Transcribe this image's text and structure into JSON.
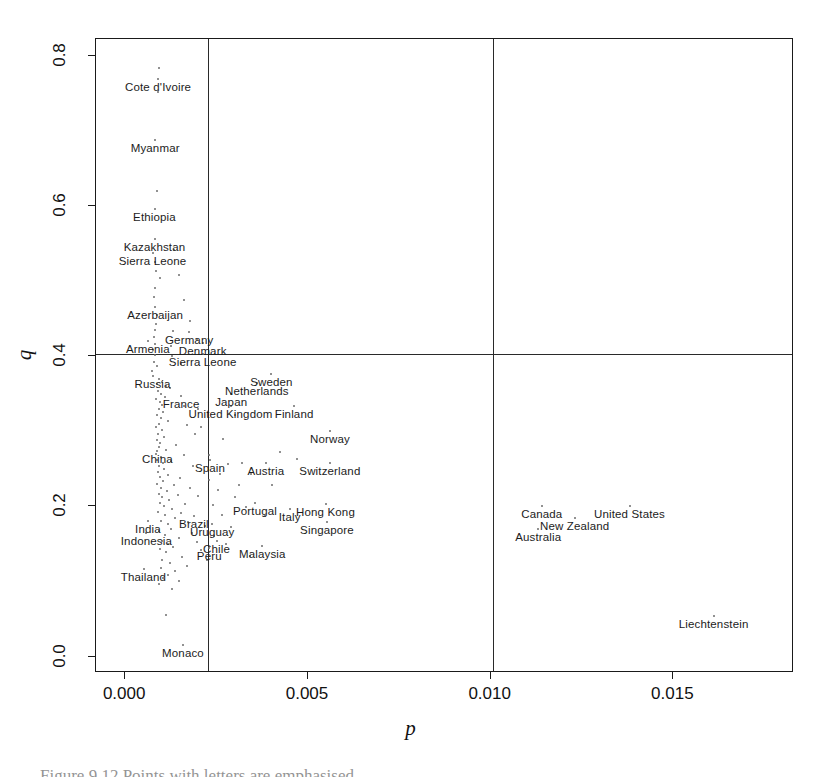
{
  "figure": {
    "caption": "Figure 9.12  Points with  letters  are  emphasised",
    "background": "#ffffff",
    "point_color": "#6d6d6d",
    "line_color": "#2a2a2a"
  },
  "chart_data": {
    "type": "scatter",
    "title": "",
    "xlabel": "p",
    "ylabel": "q",
    "xlim": [
      -0.0008,
      0.0183
    ],
    "ylim": [
      -0.022,
      0.822
    ],
    "xticks": [
      0.0,
      0.005,
      0.01,
      0.015
    ],
    "xticklabels": [
      "0.000",
      "0.005",
      "0.010",
      "0.015"
    ],
    "yticks": [
      0.0,
      0.2,
      0.4,
      0.6,
      0.8
    ],
    "yticklabels": [
      "0.0",
      "0.2",
      "0.4",
      "0.6",
      "0.8"
    ],
    "grid": false,
    "legend": null,
    "reference_lines": {
      "vertical": [
        0.00225,
        0.01005
      ],
      "horizontal": [
        0.403
      ]
    },
    "labeled_points": [
      {
        "name": "Cote d'Ivoire",
        "p": 0.0009,
        "q": 0.769
      },
      {
        "name": "Myanmar",
        "p": 0.00082,
        "q": 0.688
      },
      {
        "name": "Ethiopia",
        "p": 0.0008,
        "q": 0.596
      },
      {
        "name": "Kazakhstan",
        "p": 0.0008,
        "q": 0.556
      },
      {
        "name": "Sierra Leone",
        "p": 0.00075,
        "q": 0.537
      },
      {
        "name": "Azerbaijan",
        "p": 0.00082,
        "q": 0.465
      },
      {
        "name": "Armenia",
        "p": 0.00062,
        "q": 0.42
      },
      {
        "name": "Germany",
        "p": 0.00175,
        "q": 0.432
      },
      {
        "name": "Denmark",
        "p": 0.00212,
        "q": 0.418
      },
      {
        "name": "Sierra Leone",
        "p": 0.00212,
        "q": 0.403
      },
      {
        "name": "Russia",
        "p": 0.00075,
        "q": 0.374
      },
      {
        "name": "Sweden",
        "p": 0.004,
        "q": 0.376
      },
      {
        "name": "Netherlands",
        "p": 0.0036,
        "q": 0.364
      },
      {
        "name": "France",
        "p": 0.00153,
        "q": 0.347
      },
      {
        "name": "Japan",
        "p": 0.0029,
        "q": 0.349
      },
      {
        "name": "United Kingdom",
        "p": 0.00288,
        "q": 0.333
      },
      {
        "name": "Finland",
        "p": 0.00462,
        "q": 0.333
      },
      {
        "name": "Norway",
        "p": 0.0056,
        "q": 0.3
      },
      {
        "name": "China",
        "p": 0.00088,
        "q": 0.273
      },
      {
        "name": "Spain",
        "p": 0.00232,
        "q": 0.262
      },
      {
        "name": "Austria",
        "p": 0.00385,
        "q": 0.258
      },
      {
        "name": "Switzerland",
        "p": 0.0056,
        "q": 0.257
      },
      {
        "name": "Portugal",
        "p": 0.00355,
        "q": 0.204
      },
      {
        "name": "Italy",
        "p": 0.0045,
        "q": 0.196
      },
      {
        "name": "Hong Kong",
        "p": 0.00548,
        "q": 0.203
      },
      {
        "name": "Singapore",
        "p": 0.00552,
        "q": 0.179
      },
      {
        "name": "Canada",
        "p": 0.0114,
        "q": 0.201
      },
      {
        "name": "United States",
        "p": 0.0138,
        "q": 0.201
      },
      {
        "name": "New Zealand",
        "p": 0.0123,
        "q": 0.185
      },
      {
        "name": "Australia",
        "p": 0.0113,
        "q": 0.17
      },
      {
        "name": "India",
        "p": 0.00062,
        "q": 0.18
      },
      {
        "name": "Brazil",
        "p": 0.00188,
        "q": 0.187
      },
      {
        "name": "Uruguay",
        "p": 0.00238,
        "q": 0.176
      },
      {
        "name": "Indonesia",
        "p": 0.00058,
        "q": 0.164
      },
      {
        "name": "Chile",
        "p": 0.0025,
        "q": 0.154
      },
      {
        "name": "Peru",
        "p": 0.0023,
        "q": 0.144
      },
      {
        "name": "Malaysia",
        "p": 0.00375,
        "q": 0.147
      },
      {
        "name": "Thailand",
        "p": 0.0005,
        "q": 0.117
      },
      {
        "name": "Liechtenstein",
        "p": 0.0161,
        "q": 0.054
      },
      {
        "name": "Monaco",
        "p": 0.00158,
        "q": 0.016
      }
    ],
    "unlabeled_points": [
      {
        "p": 0.00091,
        "q": 0.7835
      },
      {
        "p": 0.0009,
        "q": 0.752
      },
      {
        "p": 0.00086,
        "q": 0.62
      },
      {
        "p": 0.00082,
        "q": 0.525
      },
      {
        "p": 0.00083,
        "q": 0.513
      },
      {
        "p": 0.00095,
        "q": 0.504
      },
      {
        "p": 0.00148,
        "q": 0.508
      },
      {
        "p": 0.0008,
        "q": 0.49
      },
      {
        "p": 0.00078,
        "q": 0.478
      },
      {
        "p": 0.00086,
        "q": 0.455
      },
      {
        "p": 0.00083,
        "q": 0.443
      },
      {
        "p": 0.0008,
        "q": 0.435
      },
      {
        "p": 0.0013,
        "q": 0.434
      },
      {
        "p": 0.00078,
        "q": 0.425
      },
      {
        "p": 0.00082,
        "q": 0.416
      },
      {
        "p": 0.00125,
        "q": 0.414
      },
      {
        "p": 0.00076,
        "q": 0.408
      },
      {
        "p": 0.00082,
        "q": 0.402
      },
      {
        "p": 0.00128,
        "q": 0.4
      },
      {
        "p": 0.00079,
        "q": 0.392
      },
      {
        "p": 0.00086,
        "q": 0.387
      },
      {
        "p": 0.00074,
        "q": 0.38
      },
      {
        "p": 0.00092,
        "q": 0.37
      },
      {
        "p": 0.001,
        "q": 0.366
      },
      {
        "p": 0.00088,
        "q": 0.363
      },
      {
        "p": 0.00112,
        "q": 0.36
      },
      {
        "p": 0.00122,
        "q": 0.358
      },
      {
        "p": 0.0009,
        "q": 0.354
      },
      {
        "p": 0.00098,
        "q": 0.35
      },
      {
        "p": 0.00108,
        "q": 0.346
      },
      {
        "p": 0.00085,
        "q": 0.343
      },
      {
        "p": 0.00095,
        "q": 0.339
      },
      {
        "p": 0.001,
        "q": 0.335
      },
      {
        "p": 0.0016,
        "q": 0.334
      },
      {
        "p": 0.003,
        "q": 0.321
      },
      {
        "p": 0.00091,
        "q": 0.33
      },
      {
        "p": 0.00103,
        "q": 0.326
      },
      {
        "p": 0.00088,
        "q": 0.322
      },
      {
        "p": 0.00097,
        "q": 0.318
      },
      {
        "p": 0.00118,
        "q": 0.314
      },
      {
        "p": 0.00092,
        "q": 0.31
      },
      {
        "p": 0.00084,
        "q": 0.306
      },
      {
        "p": 0.00168,
        "q": 0.308
      },
      {
        "p": 0.001,
        "q": 0.301
      },
      {
        "p": 0.0009,
        "q": 0.296
      },
      {
        "p": 0.00192,
        "q": 0.296
      },
      {
        "p": 0.00105,
        "q": 0.292
      },
      {
        "p": 0.00086,
        "q": 0.288
      },
      {
        "p": 0.00096,
        "q": 0.284
      },
      {
        "p": 0.0014,
        "q": 0.282
      },
      {
        "p": 0.00092,
        "q": 0.279
      },
      {
        "p": 0.00112,
        "q": 0.275
      },
      {
        "p": 0.00083,
        "q": 0.27
      },
      {
        "p": 0.00098,
        "q": 0.266
      },
      {
        "p": 0.0016,
        "q": 0.268
      },
      {
        "p": 0.00088,
        "q": 0.262
      },
      {
        "p": 0.00125,
        "q": 0.26
      },
      {
        "p": 0.00102,
        "q": 0.257
      },
      {
        "p": 0.00093,
        "q": 0.253
      },
      {
        "p": 0.00186,
        "q": 0.254
      },
      {
        "p": 0.0028,
        "q": 0.256
      },
      {
        "p": 0.0032,
        "q": 0.257
      },
      {
        "p": 0.00107,
        "q": 0.249
      },
      {
        "p": 0.0009,
        "q": 0.245
      },
      {
        "p": 0.00117,
        "q": 0.242
      },
      {
        "p": 0.00096,
        "q": 0.239
      },
      {
        "p": 0.0015,
        "q": 0.237
      },
      {
        "p": 0.00228,
        "q": 0.235
      },
      {
        "p": 0.00104,
        "q": 0.233
      },
      {
        "p": 0.00088,
        "q": 0.23
      },
      {
        "p": 0.00133,
        "q": 0.228
      },
      {
        "p": 0.00099,
        "q": 0.225
      },
      {
        "p": 0.00178,
        "q": 0.224
      },
      {
        "p": 0.00255,
        "q": 0.222
      },
      {
        "p": 0.00113,
        "q": 0.22
      },
      {
        "p": 0.00092,
        "q": 0.217
      },
      {
        "p": 0.00143,
        "q": 0.215
      },
      {
        "p": 0.00101,
        "q": 0.212
      },
      {
        "p": 0.002,
        "q": 0.214
      },
      {
        "p": 0.003,
        "q": 0.212
      },
      {
        "p": 0.0012,
        "q": 0.208
      },
      {
        "p": 0.00094,
        "q": 0.205
      },
      {
        "p": 0.00163,
        "q": 0.203
      },
      {
        "p": 0.00106,
        "q": 0.2
      },
      {
        "p": 0.0024,
        "q": 0.202
      },
      {
        "p": 0.0033,
        "q": 0.199
      },
      {
        "p": 0.00128,
        "q": 0.196
      },
      {
        "p": 0.0009,
        "q": 0.193
      },
      {
        "p": 0.00152,
        "q": 0.191
      },
      {
        "p": 0.0011,
        "q": 0.188
      },
      {
        "p": 0.00265,
        "q": 0.189
      },
      {
        "p": 0.00382,
        "q": 0.187
      },
      {
        "p": 0.00136,
        "q": 0.184
      },
      {
        "p": 0.00098,
        "q": 0.181
      },
      {
        "p": 0.00172,
        "q": 0.179
      },
      {
        "p": 0.00116,
        "q": 0.176
      },
      {
        "p": 0.00218,
        "q": 0.174
      },
      {
        "p": 0.0029,
        "q": 0.172
      },
      {
        "p": 0.00124,
        "q": 0.17
      },
      {
        "p": 0.00093,
        "q": 0.167
      },
      {
        "p": 0.00182,
        "q": 0.165
      },
      {
        "p": 0.00108,
        "q": 0.162
      },
      {
        "p": 0.00244,
        "q": 0.161
      },
      {
        "p": 0.00146,
        "q": 0.158
      },
      {
        "p": 0.001,
        "q": 0.154
      },
      {
        "p": 0.00196,
        "q": 0.153
      },
      {
        "p": 0.00118,
        "q": 0.15
      },
      {
        "p": 0.00275,
        "q": 0.15
      },
      {
        "p": 0.00131,
        "q": 0.146
      },
      {
        "p": 0.00095,
        "q": 0.143
      },
      {
        "p": 0.00208,
        "q": 0.142
      },
      {
        "p": 0.00112,
        "q": 0.139
      },
      {
        "p": 0.0034,
        "q": 0.134
      },
      {
        "p": 0.00155,
        "q": 0.132
      },
      {
        "p": 0.00101,
        "q": 0.129
      },
      {
        "p": 0.00224,
        "q": 0.128
      },
      {
        "p": 0.00122,
        "q": 0.125
      },
      {
        "p": 0.00168,
        "q": 0.121
      },
      {
        "p": 0.00097,
        "q": 0.118
      },
      {
        "p": 0.00136,
        "q": 0.114
      },
      {
        "p": 0.00118,
        "q": 0.108
      },
      {
        "p": 0.00103,
        "q": 0.104
      },
      {
        "p": 0.00148,
        "q": 0.101
      },
      {
        "p": 0.00092,
        "q": 0.096
      },
      {
        "p": 0.00128,
        "q": 0.09
      },
      {
        "p": 0.00112,
        "q": 0.055
      },
      {
        "p": 0.00422,
        "q": 0.272
      },
      {
        "p": 0.0047,
        "q": 0.263
      },
      {
        "p": 0.00345,
        "q": 0.243
      },
      {
        "p": 0.00402,
        "q": 0.229
      },
      {
        "p": 0.00258,
        "q": 0.243
      },
      {
        "p": 0.00312,
        "q": 0.228
      },
      {
        "p": 0.00228,
        "q": 0.268
      },
      {
        "p": 0.00268,
        "q": 0.29
      },
      {
        "p": 0.00208,
        "q": 0.306
      },
      {
        "p": 0.00198,
        "q": 0.33
      },
      {
        "p": 0.00152,
        "q": 0.389
      },
      {
        "p": 0.00196,
        "q": 0.421
      },
      {
        "p": 0.00176,
        "q": 0.446
      },
      {
        "p": 0.0016,
        "q": 0.474
      },
      {
        "p": 0.00132,
        "q": 0.541
      }
    ]
  }
}
